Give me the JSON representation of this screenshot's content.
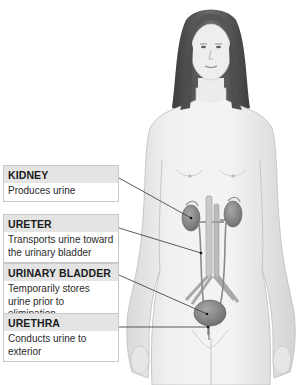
{
  "figure": {
    "labels": [
      {
        "id": "kidney",
        "title": "KIDNEY",
        "description": "Produces urine"
      },
      {
        "id": "ureter",
        "title": "URETER",
        "description": "Transports urine toward the urinary bladder"
      },
      {
        "id": "bladder",
        "title": "URINARY BLADDER",
        "description": "Temporarily stores urine prior to elimination"
      },
      {
        "id": "urethra",
        "title": "URETHRA",
        "description": "Conducts urine to exterior"
      }
    ]
  },
  "colors": {
    "label_header_bg": "#e4e4e4",
    "label_border": "#c9c9c9",
    "leader_line": "#333333",
    "kidney": "#8a8a8a",
    "bladder": "#7d7d7d",
    "skin": "#efefef",
    "hair": "#5a5a5a"
  }
}
